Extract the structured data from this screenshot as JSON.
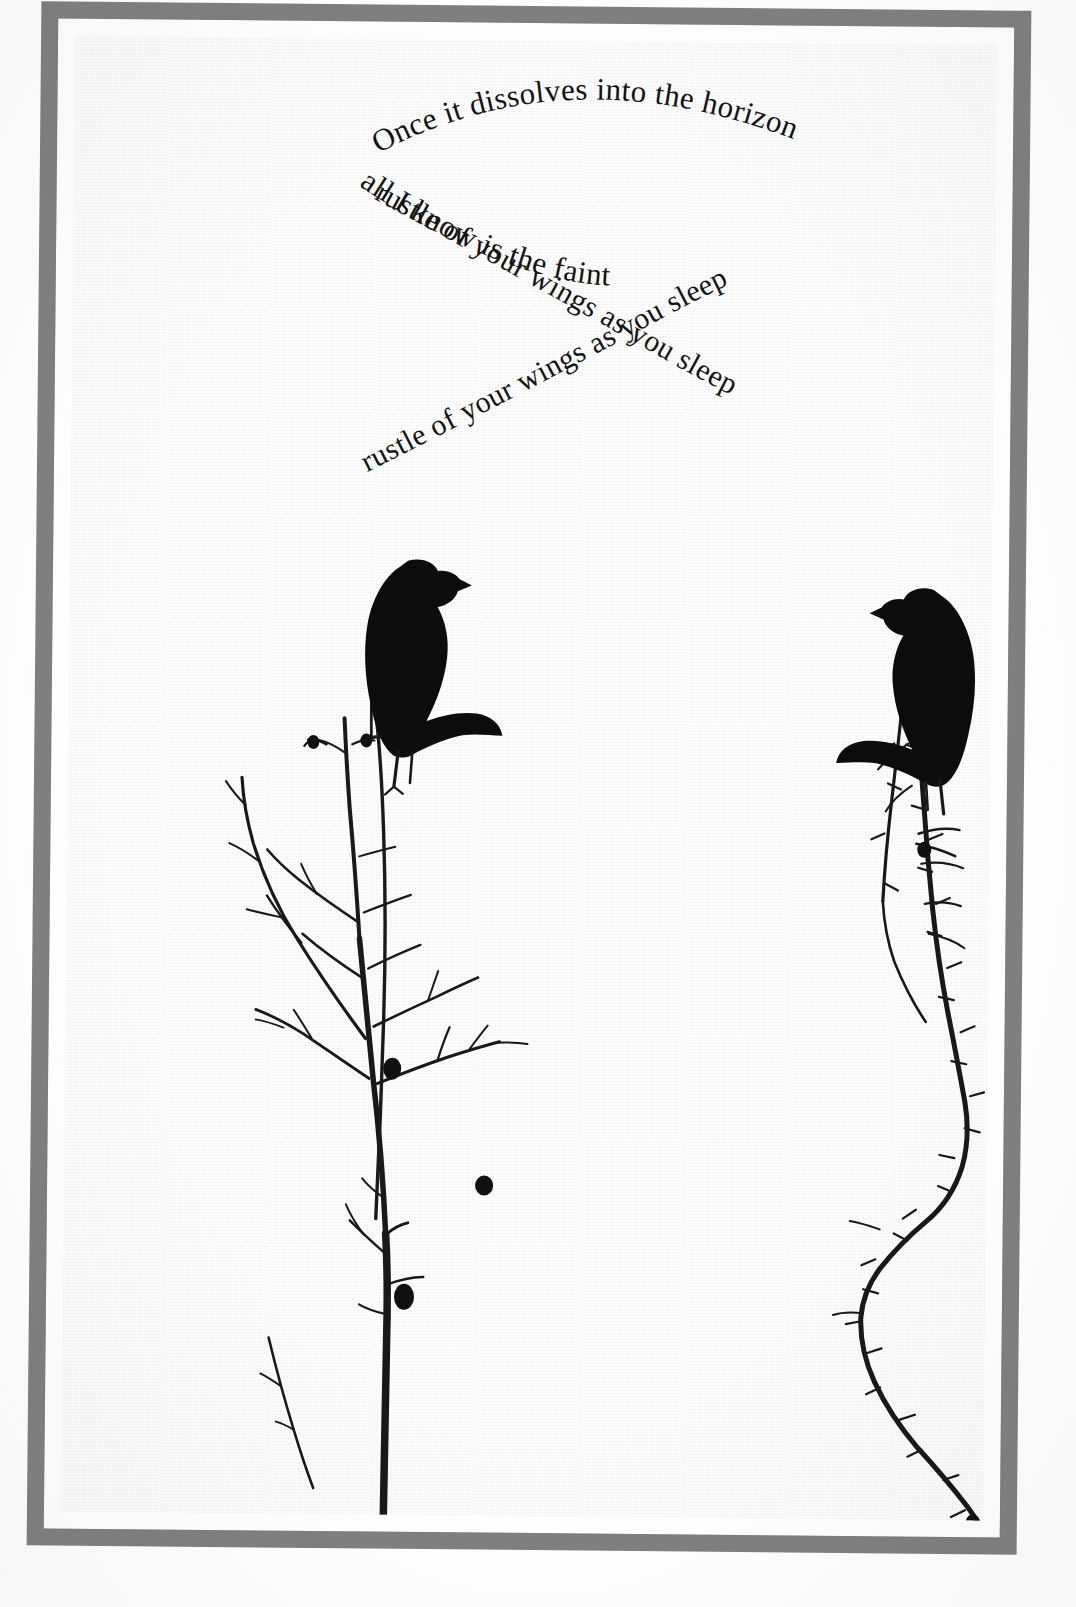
{
  "artwork": {
    "title": "Once it dissolves into the horizon",
    "medium": "framed print",
    "frame_color": "#808080",
    "paper_color": "#fefefe",
    "ink_color": "#141414"
  },
  "poem": {
    "full_text": "Once it dissolves into the horizon all I know is the faint rustle of your wings as you sleep",
    "lines": [
      {
        "id": "line-arc-upright",
        "text": "Once it dissolves into the horizon",
        "orientation": "arc-upright"
      },
      {
        "id": "line-arc-inverted",
        "text": "all I know is the faint",
        "orientation": "arc-rotated-180"
      },
      {
        "id": "line-diagonal-upright",
        "text": "rustle of your wings as you sleep",
        "orientation": "diagonal-descending-upright"
      },
      {
        "id": "line-diagonal-inverted",
        "text": "rustle of your wings as you sleep",
        "orientation": "diagonal-descending-rotated-180"
      }
    ]
  },
  "figures": {
    "bird_left": "crow-silhouette-facing-right",
    "bird_right": "crow-silhouette-facing-left",
    "branch_left": "bare-winter-branch",
    "branch_right": "thorny-vine-branch"
  }
}
